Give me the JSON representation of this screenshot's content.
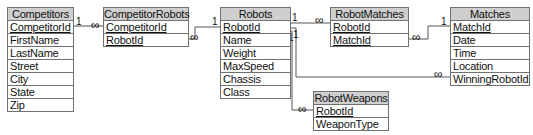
{
  "diagram": {
    "type": "entity-relationship",
    "tables": [
      {
        "name": "Competitors",
        "fields": [
          {
            "label": "CompetitorId",
            "key": true
          },
          {
            "label": "FirstName",
            "key": false
          },
          {
            "label": "LastName",
            "key": false
          },
          {
            "label": "Street",
            "key": false
          },
          {
            "label": "City",
            "key": false
          },
          {
            "label": "State",
            "key": false
          },
          {
            "label": "Zip",
            "key": false
          }
        ]
      },
      {
        "name": "CompetitorRobots",
        "fields": [
          {
            "label": "CompetitorId",
            "key": true
          },
          {
            "label": "RobotId",
            "key": true
          }
        ]
      },
      {
        "name": "Robots",
        "fields": [
          {
            "label": "RobotId",
            "key": true
          },
          {
            "label": "Name",
            "key": false
          },
          {
            "label": "Weight",
            "key": false
          },
          {
            "label": "MaxSpeed",
            "key": false
          },
          {
            "label": "Chassis",
            "key": false
          },
          {
            "label": "Class",
            "key": false
          }
        ]
      },
      {
        "name": "RobotMatches",
        "fields": [
          {
            "label": "RobotId",
            "key": true
          },
          {
            "label": "MatchId",
            "key": true
          }
        ]
      },
      {
        "name": "Matches",
        "fields": [
          {
            "label": "MatchId",
            "key": true
          },
          {
            "label": "Date",
            "key": false
          },
          {
            "label": "Time",
            "key": false
          },
          {
            "label": "Location",
            "key": false
          },
          {
            "label": "WinningRobotId",
            "key": false
          }
        ]
      },
      {
        "name": "RobotWeapons",
        "fields": [
          {
            "label": "RobotId",
            "key": true
          },
          {
            "label": "WeaponType",
            "key": false
          }
        ]
      }
    ],
    "relationships": [
      {
        "from": "Competitors.CompetitorId",
        "to": "CompetitorRobots.CompetitorId",
        "from_card": "1",
        "to_card": "∞"
      },
      {
        "from": "Robots.RobotId",
        "to": "CompetitorRobots.RobotId",
        "from_card": "1",
        "to_card": "∞"
      },
      {
        "from": "Robots.RobotId",
        "to": "RobotMatches.RobotId",
        "from_card": "1",
        "to_card": "∞"
      },
      {
        "from": "Matches.MatchId",
        "to": "RobotMatches.MatchId",
        "from_card": "1",
        "to_card": "∞"
      },
      {
        "from": "Robots.RobotId",
        "to": "Matches.WinningRobotId",
        "from_card": "1",
        "to_card": "∞"
      },
      {
        "from": "Robots.RobotId",
        "to": "RobotWeapons.RobotId",
        "from_card": "1",
        "to_card": "∞"
      }
    ],
    "cardinality": {
      "one": "1",
      "many": "∞"
    }
  }
}
